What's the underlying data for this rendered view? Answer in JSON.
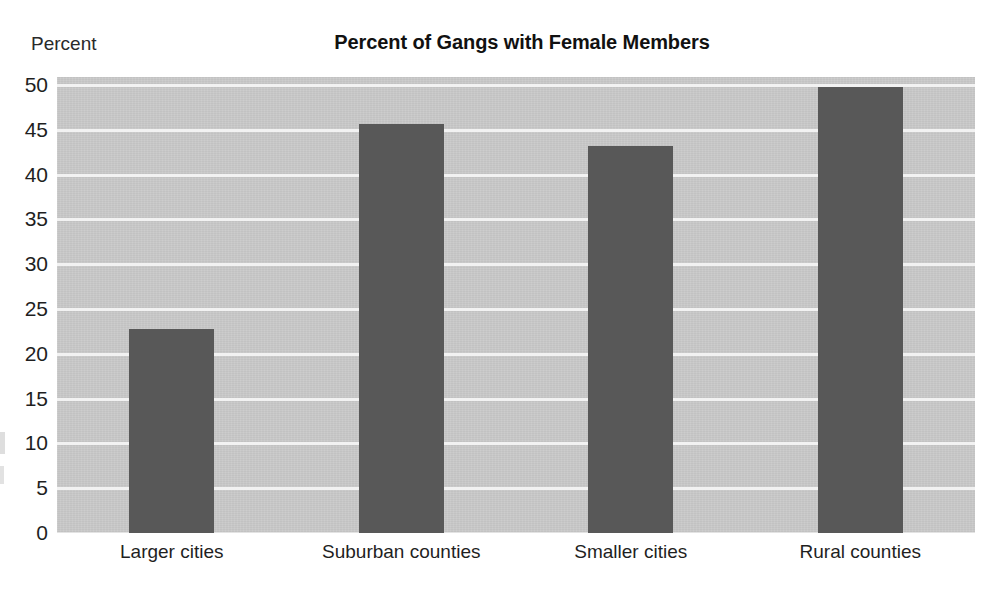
{
  "chart_data": {
    "type": "bar",
    "title": "Percent of Gangs with Female Members",
    "xlabel": "",
    "ylabel": "Percent",
    "categories": [
      "Larger cities",
      "Suburban counties",
      "Smaller cities",
      "Rural counties"
    ],
    "values": [
      22.8,
      45.6,
      43.2,
      49.8
    ],
    "ylim": [
      0,
      50
    ],
    "ytick_labels": [
      "50",
      "45",
      "40",
      "35",
      "30",
      "25",
      "20",
      "15",
      "10",
      "5",
      "0"
    ],
    "ytick_values": [
      50,
      45,
      40,
      35,
      30,
      25,
      20,
      15,
      10,
      5,
      0
    ],
    "grid": true,
    "legend": "none",
    "colors": {
      "bar": "#585858",
      "plot_background": "#c9c9c9",
      "gridline": "#f2f2f2",
      "page_background": "#ffffff",
      "text": "#1f1f1f"
    }
  }
}
